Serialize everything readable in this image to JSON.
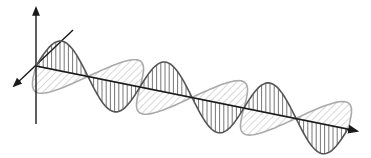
{
  "figure": {
    "title": "",
    "width": 371,
    "height": 158
  },
  "axes": {
    "origin": [
      36,
      66
    ],
    "vertical_axis": {
      "from": [
        36,
        124
      ],
      "to": [
        36,
        8
      ]
    },
    "depth_axis": {
      "from": [
        73,
        30
      ],
      "to": [
        14,
        86
      ]
    },
    "propagation_axis": {
      "from": [
        36,
        66
      ],
      "to": [
        359,
        131
      ]
    }
  },
  "waves": [
    {
      "name": "vertical-field",
      "style": "dark outline with vertical line fill",
      "stroke": "#555555",
      "fill_lines": "#666666",
      "amplitude_px": 30,
      "period_px": 104,
      "cycles": 3,
      "direction": "vertical"
    },
    {
      "name": "horizontal-field",
      "style": "light outline with diagonal hatch fill",
      "stroke": "#aaaaaa",
      "fill_lines": "#b5b5b5",
      "amplitude_px": 32,
      "period_px": 104,
      "cycles": 3,
      "direction": "depth"
    }
  ],
  "colors": {
    "axis": "#1a1a1a",
    "background": "#ffffff"
  }
}
